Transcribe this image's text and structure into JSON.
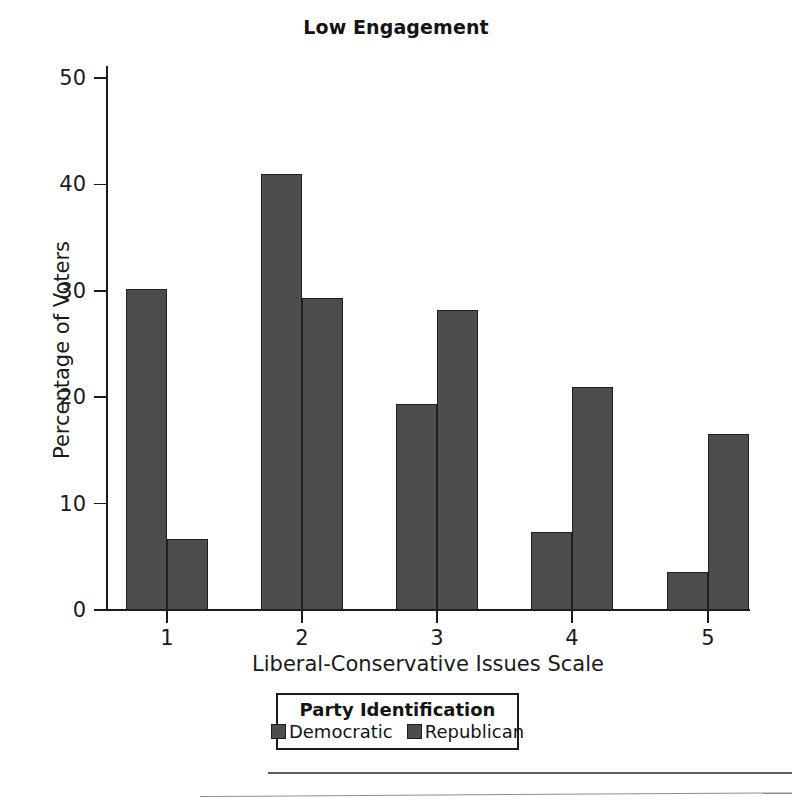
{
  "chart_data": {
    "type": "bar",
    "title": "Low Engagement",
    "xlabel": "Liberal-Conservative Issues Scale",
    "ylabel": "Percentage of Voters",
    "categories": [
      "1",
      "2",
      "3",
      "4",
      "5"
    ],
    "series": [
      {
        "name": "Democratic",
        "color": "#4d4d4d",
        "values": [
          30.2,
          41.0,
          19.4,
          7.3,
          3.6
        ]
      },
      {
        "name": "Republican",
        "color": "#4d4d4d",
        "values": [
          6.7,
          29.3,
          28.2,
          21.0,
          16.5
        ]
      }
    ],
    "ylim": [
      0,
      52
    ],
    "yticks": [
      0,
      10,
      20,
      30,
      40,
      50
    ],
    "ytick_labels": [
      "0",
      "10",
      "20",
      "30",
      "40",
      "50"
    ],
    "xtick_labels": [
      "1",
      "2",
      "3",
      "4",
      "5"
    ],
    "grid": false,
    "legend_position": "below-axes-center",
    "legend_title": "Party Identification"
  },
  "legend": {
    "title": "Party Identification",
    "entries": [
      {
        "label": "Democratic",
        "swatch": "legend-swatch-democratic"
      },
      {
        "label": "Republican",
        "swatch": "legend-swatch-republican"
      }
    ]
  }
}
